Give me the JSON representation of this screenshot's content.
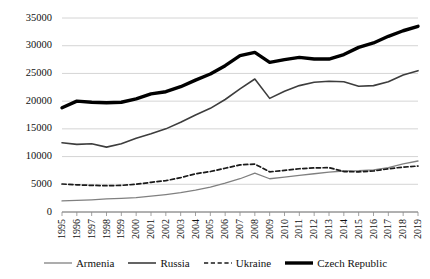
{
  "chart_data": {
    "type": "line",
    "title": "",
    "xlabel": "",
    "ylabel": "",
    "grid": true,
    "legend_position": "bottom",
    "ylim": [
      0,
      35000
    ],
    "yticks": [
      0,
      5000,
      10000,
      15000,
      20000,
      25000,
      30000,
      35000
    ],
    "ytick_labels": [
      "0",
      "5000",
      "10000",
      "15000",
      "20000",
      "25000",
      "30000",
      "35000"
    ],
    "x": [
      1995,
      1996,
      1997,
      1998,
      1999,
      2000,
      2001,
      2002,
      2003,
      2004,
      2005,
      2006,
      2007,
      2008,
      2009,
      2010,
      2011,
      2012,
      2013,
      2014,
      2015,
      2016,
      2017,
      2018,
      2019
    ],
    "categories": [
      "1995",
      "1996",
      "1997",
      "1998",
      "1999",
      "2000",
      "2001",
      "2002",
      "2003",
      "2004",
      "2005",
      "2006",
      "2007",
      "2008",
      "2009",
      "2010",
      "2011",
      "2012",
      "2013",
      "2014",
      "2015",
      "2016",
      "2017",
      "2018",
      "2019"
    ],
    "series": [
      {
        "name": "Armenia",
        "color": "#808080",
        "width": 1.3,
        "dash": "none",
        "values": [
          2000,
          2100,
          2200,
          2350,
          2450,
          2600,
          2850,
          3150,
          3500,
          3950,
          4500,
          5200,
          6000,
          7000,
          6000,
          6300,
          6600,
          6900,
          7200,
          7400,
          7450,
          7600,
          8000,
          8700,
          9200
        ]
      },
      {
        "name": "Russia",
        "color": "#3d3d3d",
        "width": 1.6,
        "dash": "none",
        "values": [
          12500,
          12200,
          12300,
          11700,
          12300,
          13300,
          14100,
          15000,
          16200,
          17500,
          18700,
          20300,
          22200,
          24000,
          20500,
          21800,
          22800,
          23400,
          23600,
          23500,
          22700,
          22800,
          23500,
          24700,
          25500
        ]
      },
      {
        "name": "Ukraine",
        "color": "#1a1a1a",
        "width": 1.7,
        "dash": "dashed",
        "values": [
          5050,
          4900,
          4800,
          4750,
          4800,
          5000,
          5350,
          5650,
          6200,
          6900,
          7300,
          7900,
          8500,
          8650,
          7250,
          7500,
          7800,
          7950,
          8000,
          7300,
          7250,
          7400,
          7800,
          8100,
          8300
        ]
      },
      {
        "name": "Czech Republic",
        "color": "#000000",
        "width": 3.4,
        "dash": "none",
        "values": [
          18800,
          20000,
          19800,
          19700,
          19800,
          20400,
          21300,
          21700,
          22600,
          23800,
          24900,
          26400,
          28200,
          28800,
          27000,
          27500,
          27900,
          27600,
          27600,
          28400,
          29700,
          30500,
          31700,
          32700,
          33500
        ]
      }
    ]
  }
}
